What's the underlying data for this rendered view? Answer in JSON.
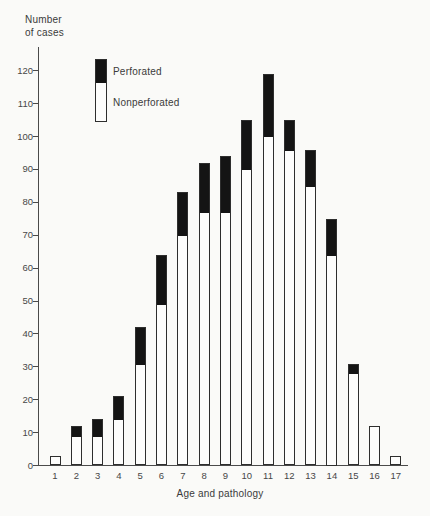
{
  "figure": {
    "ylabel_line1": "Number",
    "ylabel_line2": "of cases",
    "xlabel": "Age and pathology"
  },
  "legend": {
    "entries": [
      {
        "label": "Perforated",
        "swatch_color": "#141414"
      },
      {
        "label": "Nonperforated",
        "swatch_color": "#fdfdfc"
      }
    ]
  },
  "chart_data": {
    "type": "bar",
    "stacked": true,
    "xlabel": "Age and pathology",
    "ylabel": "Number of cases",
    "categories": [
      "1",
      "2",
      "3",
      "4",
      "5",
      "6",
      "7",
      "8",
      "9",
      "10",
      "11",
      "12",
      "13",
      "14",
      "15",
      "16",
      "17"
    ],
    "series": [
      {
        "name": "Nonperforated",
        "color": "#fdfdfc",
        "values": [
          3,
          9,
          9,
          14,
          31,
          49,
          70,
          77,
          77,
          90,
          100,
          96,
          85,
          64,
          28,
          12,
          3
        ]
      },
      {
        "name": "Perforated",
        "color": "#141414",
        "values": [
          0,
          3,
          5,
          7,
          11,
          15,
          13,
          15,
          17,
          15,
          19,
          9,
          11,
          11,
          3,
          0,
          0
        ]
      }
    ],
    "totals": [
      3,
      12,
      14,
      21,
      42,
      64,
      83,
      92,
      94,
      105,
      119,
      105,
      96,
      75,
      31,
      12,
      3
    ],
    "ylim": [
      0,
      127
    ],
    "yticks": [
      0,
      10,
      20,
      30,
      40,
      50,
      60,
      70,
      80,
      90,
      100,
      110,
      120
    ],
    "grid": false,
    "legend_position": "top-left"
  }
}
